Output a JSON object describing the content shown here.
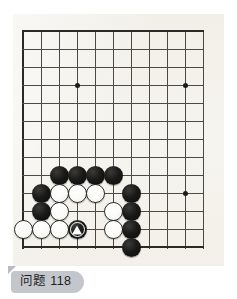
{
  "diagram": {
    "type": "go-board-problem",
    "title": "问题 118",
    "board": {
      "background_color": "#f4f2ec",
      "line_color": "#4a4a46",
      "edge_color": "#2a2a28",
      "cell_size": 18,
      "origin_x": 23,
      "origin_y": 31,
      "columns": 11,
      "rows": 13,
      "edges": {
        "left": true,
        "top": true,
        "bottom": true,
        "right": false
      },
      "star_points": [
        {
          "col": 3,
          "row": 3
        },
        {
          "col": 9,
          "row": 3
        },
        {
          "col": 9,
          "row": 9
        }
      ]
    },
    "stones": [
      {
        "color": "black",
        "col": 2,
        "row": 8,
        "marker": "none"
      },
      {
        "color": "black",
        "col": 3,
        "row": 8,
        "marker": "none"
      },
      {
        "color": "black",
        "col": 4,
        "row": 8,
        "marker": "none"
      },
      {
        "color": "black",
        "col": 5,
        "row": 8,
        "marker": "none"
      },
      {
        "color": "black",
        "col": 1,
        "row": 9,
        "marker": "none"
      },
      {
        "color": "white",
        "col": 2,
        "row": 9,
        "marker": "none"
      },
      {
        "color": "white",
        "col": 3,
        "row": 9,
        "marker": "none"
      },
      {
        "color": "white",
        "col": 4,
        "row": 9,
        "marker": "none"
      },
      {
        "color": "black",
        "col": 6,
        "row": 9,
        "marker": "none"
      },
      {
        "color": "black",
        "col": 1,
        "row": 10,
        "marker": "none"
      },
      {
        "color": "white",
        "col": 2,
        "row": 10,
        "marker": "none"
      },
      {
        "color": "white",
        "col": 5,
        "row": 10,
        "marker": "none"
      },
      {
        "color": "black",
        "col": 6,
        "row": 10,
        "marker": "none"
      },
      {
        "color": "white",
        "col": 0,
        "row": 11,
        "marker": "none"
      },
      {
        "color": "white",
        "col": 1,
        "row": 11,
        "marker": "none"
      },
      {
        "color": "white",
        "col": 2,
        "row": 11,
        "marker": "none"
      },
      {
        "color": "black",
        "col": 3,
        "row": 11,
        "marker": "triangle"
      },
      {
        "color": "white",
        "col": 5,
        "row": 11,
        "marker": "none"
      },
      {
        "color": "black",
        "col": 6,
        "row": 11,
        "marker": "none"
      },
      {
        "color": "black",
        "col": 6,
        "row": 12,
        "marker": "none"
      }
    ]
  },
  "caption": {
    "label": "问题 118",
    "background_color": "#c3c6cb",
    "text_color": "#1f1f1f"
  }
}
